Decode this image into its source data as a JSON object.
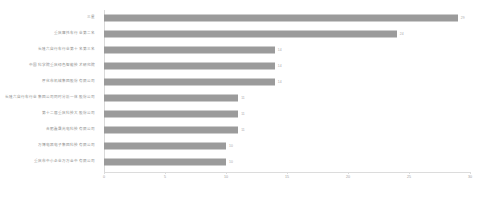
{
  "chart_data": {
    "type": "bar",
    "orientation": "horizontal",
    "title": "",
    "xlabel": "",
    "ylabel": "",
    "xlim": [
      0,
      30
    ],
    "xticks": [
      "0",
      "5",
      "10",
      "15",
      "20",
      "25",
      "30"
    ],
    "grid": false,
    "legend": null,
    "series_color": "#9b9b9b",
    "categories": [
      "三星",
      "重庆摩托车行业第二名",
      "长隆六自行车行业第十名第三名",
      "中国科学院重庆绿色智能技术研究院",
      "厚化市机械集团股份有限公司",
      "长隆六自行车行业集团公司同时分析一体股份公司",
      "第十二届重庆科技大股份公司",
      "合肥鑫晟光电科技有限公司",
      "万博电器电子集团科技有限公司",
      "重庆市中小企业万万金中有限公司"
    ],
    "values": [
      29,
      24,
      14,
      14,
      14,
      11,
      11,
      11,
      10,
      10
    ],
    "value_labels": [
      "29",
      "24",
      "14",
      "14",
      "14",
      "11",
      "11",
      "11",
      "10",
      "10"
    ]
  }
}
